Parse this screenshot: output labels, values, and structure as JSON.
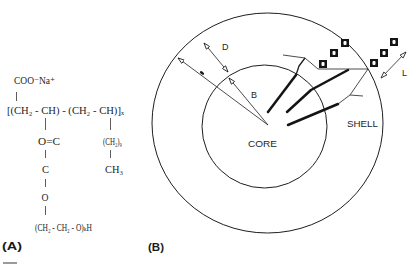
{
  "figure": {
    "panel_a_label": "(A)",
    "panel_b_label": "(B)"
  },
  "structure": {
    "carboxylate": "COO⁻Na⁺",
    "backbone": "[(CH₂ - CH) - (CH₂ - CH)]ₓ",
    "ester_carbonyl": "O=C",
    "alkyl_chain": "(CH₂)₉",
    "carbon": "C",
    "methyl": "CH₃",
    "oxygen": "O",
    "peg_chain": "(CH₂ - CH₂ - O)ₖH"
  },
  "diagram": {
    "core_label": "CORE",
    "shell_label": "SHELL",
    "dimension_labels": {
      "shell_thickness": "D",
      "core_radius": "B",
      "segment_length": "L"
    },
    "monomer_unit_icon": "black-square-unit-icon"
  },
  "colors": {
    "line": "#1e1e1e",
    "text": "#262626",
    "background": "#ffffff"
  }
}
